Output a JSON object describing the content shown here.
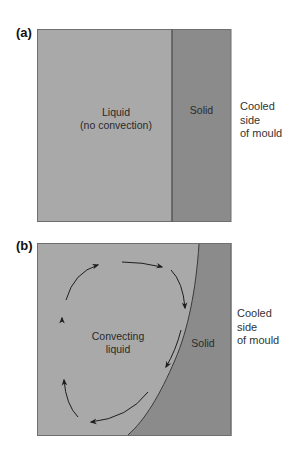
{
  "figure": {
    "colors": {
      "liquid": "#a9a9a9",
      "solid": "#8b8b8b",
      "border": "#6f6f6f",
      "arrow": "#1e1e1e",
      "background": "#ffffff"
    },
    "panel_a": {
      "label": "(a)",
      "liquid_label_line1": "Liquid",
      "liquid_label_line2": "(no convection)",
      "solid_label": "Solid",
      "side_label_line1": "Cooled",
      "side_label_line2": "side",
      "side_label_line3": "of mould"
    },
    "panel_b": {
      "label": "(b)",
      "liquid_label_line1": "Convecting",
      "liquid_label_line2": "liquid",
      "solid_label": "Solid",
      "side_label_line1": "Cooled",
      "side_label_line2": "side",
      "side_label_line3": "of mould"
    }
  }
}
